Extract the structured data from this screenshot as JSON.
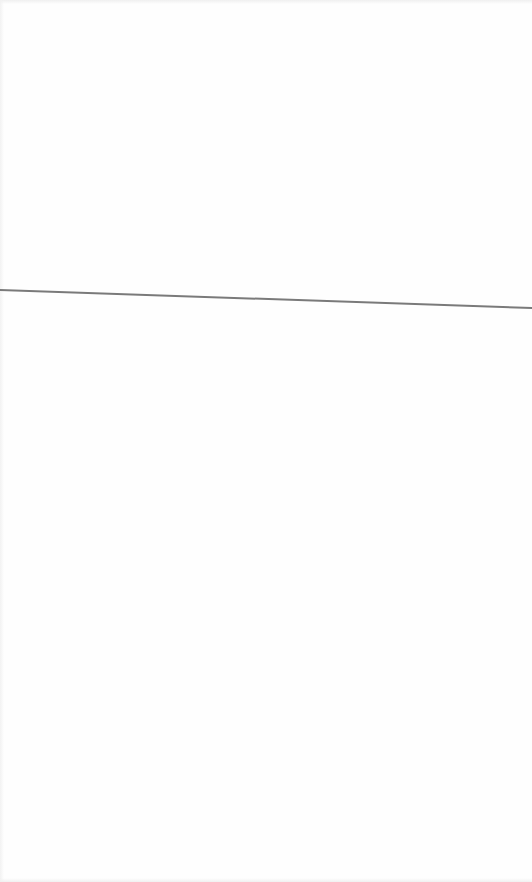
{
  "page": {
    "background_color": "#fefefe"
  },
  "rule_line": {
    "color": "#7a7a7a",
    "x1": 0,
    "y1": 290,
    "x2": 532,
    "y2": 308,
    "stroke_width": 2
  }
}
